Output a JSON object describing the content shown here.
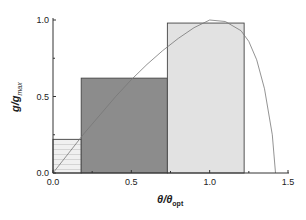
{
  "chart_data": {
    "type": "bar",
    "title": "",
    "xlabel": "θ/θ_opt",
    "ylabel": "g/g_max",
    "xlim": [
      0,
      1.5
    ],
    "ylim": [
      0,
      1.0
    ],
    "grid": false,
    "legend": null,
    "x_ticks": [
      "0.0",
      "0.5",
      "1.0",
      "1.5"
    ],
    "y_ticks": [
      "0.0",
      "0.5",
      "1.0"
    ],
    "bars": [
      {
        "x_start": 0.0,
        "x_end": 0.18,
        "height": 0.22,
        "fill": "#eeeeee",
        "pattern": "horizontal-hatch"
      },
      {
        "x_start": 0.18,
        "x_end": 0.73,
        "height": 0.62,
        "fill": "#8c8c8c",
        "pattern": "none"
      },
      {
        "x_start": 0.73,
        "x_end": 1.22,
        "height": 0.98,
        "fill": "#e2e2e2",
        "pattern": "none"
      }
    ],
    "curve": {
      "type": "line",
      "description": "g/g_max vs θ/θ_opt, rises from 0, peaks at 1.0 near θ/θ_opt=1.0, falls steeply to 0 at ≈1.42",
      "x": [
        0.0,
        0.1,
        0.2,
        0.3,
        0.4,
        0.5,
        0.6,
        0.7,
        0.8,
        0.9,
        1.0,
        1.1,
        1.2,
        1.25,
        1.3,
        1.35,
        1.4,
        1.42
      ],
      "y": [
        0.0,
        0.13,
        0.26,
        0.38,
        0.5,
        0.61,
        0.71,
        0.8,
        0.88,
        0.95,
        1.0,
        0.99,
        0.93,
        0.86,
        0.74,
        0.55,
        0.25,
        0.0
      ]
    }
  },
  "axes": {
    "x_label_main": "θ/θ",
    "x_label_sub": "opt",
    "y_label_main": "g/g",
    "y_label_sub": "max"
  }
}
